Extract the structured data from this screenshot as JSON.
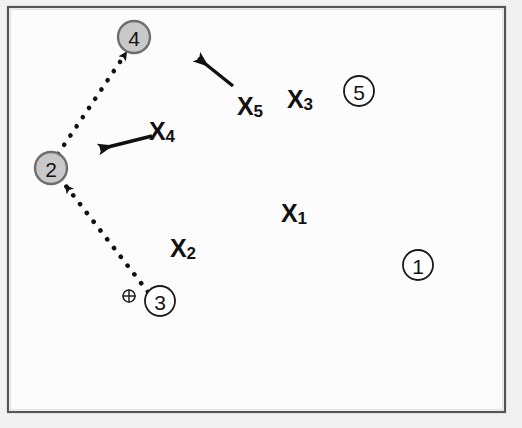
{
  "figure": {
    "name": "spatial-node-diagram",
    "background_color": "#fbfbfb",
    "frame_color": "#4a4a4a",
    "outer_margin_color": "#f2f2f2"
  },
  "colors": {
    "node_filled_fill": "#c9c9c9",
    "node_filled_stroke": "#6e6e6e",
    "node_open_fill": "#ffffff",
    "node_open_stroke": "#1a1a1a",
    "line_color": "#111111",
    "text_color": "#111111"
  },
  "nodes": [
    {
      "id": "node-4",
      "label": "4",
      "style": "filled",
      "cx": 134,
      "cy": 37,
      "r": 16
    },
    {
      "id": "node-2",
      "label": "2",
      "style": "filled",
      "cx": 51,
      "cy": 168,
      "r": 16
    },
    {
      "id": "node-3",
      "label": "3",
      "style": "open",
      "cx": 160,
      "cy": 301,
      "r": 15
    },
    {
      "id": "node-5",
      "label": "5",
      "style": "open",
      "cx": 359,
      "cy": 91,
      "r": 15
    },
    {
      "id": "node-1",
      "label": "1",
      "style": "open",
      "cx": 418,
      "cy": 265,
      "r": 15
    }
  ],
  "dotted_paths": [
    {
      "id": "path-3-to-2",
      "from": "node-3",
      "to": "node-2",
      "x1": 148,
      "y1": 292,
      "x2": 62,
      "y2": 182,
      "arrowhead_at": "to"
    },
    {
      "id": "path-2-to-4",
      "from": "node-2",
      "to": "node-4",
      "x1": 58,
      "y1": 154,
      "x2": 122,
      "y2": 49,
      "arrowhead_at": "to"
    }
  ],
  "annotation_arrows": [
    {
      "id": "arrow-x5",
      "label_base": "X",
      "label_sub": "5",
      "label_x": 250,
      "label_y": 106,
      "tail_x": 233,
      "tail_y": 86,
      "tip_x": 196,
      "tip_y": 56
    },
    {
      "id": "arrow-x4",
      "label_base": "X",
      "label_sub": "4",
      "label_x": 175,
      "label_y": 131,
      "tail_x": 152,
      "tail_y": 136,
      "tip_x": 95,
      "tip_y": 150
    }
  ],
  "variable_labels": [
    {
      "id": "label-x5",
      "base": "X",
      "sub": "5",
      "x": 250,
      "y": 106
    },
    {
      "id": "label-x4",
      "base": "X",
      "sub": "4",
      "x": 175,
      "y": 131
    },
    {
      "id": "label-x3",
      "base": "X",
      "sub": "3",
      "x": 313,
      "y": 99
    },
    {
      "id": "label-x1",
      "base": "X",
      "sub": "1",
      "x": 307,
      "y": 213
    },
    {
      "id": "label-x2",
      "base": "X",
      "sub": "2",
      "x": 196,
      "y": 248
    }
  ],
  "crosshair_marker": {
    "id": "crosshair-marker",
    "cx": 129,
    "cy": 296,
    "r": 6
  }
}
